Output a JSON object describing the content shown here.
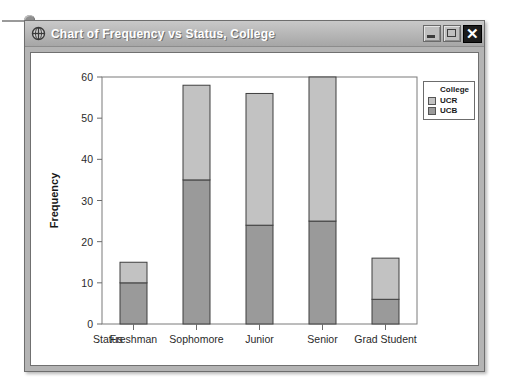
{
  "window": {
    "title": "Chart of Frequency vs Status, College",
    "icon": "crosshair-globe-icon",
    "buttons": {
      "minimize": "_",
      "maximize": "□",
      "close": "✕"
    }
  },
  "legend": {
    "title": "College",
    "entries": [
      {
        "label": "UCR",
        "color": "#c2c2c2"
      },
      {
        "label": "UCB",
        "color": "#9a9a9a"
      }
    ]
  },
  "chart_data": {
    "type": "bar",
    "stacked": true,
    "title": "",
    "xlabel": "Status",
    "ylabel": "Frequency",
    "categories": [
      "Freshman",
      "Sophomore",
      "Junior",
      "Senior",
      "Grad Student"
    ],
    "series": [
      {
        "name": "UCB",
        "color": "#9a9a9a",
        "values": [
          10,
          35,
          24,
          25,
          6
        ]
      },
      {
        "name": "UCR",
        "color": "#c2c2c2",
        "values": [
          5,
          23,
          32,
          35,
          10
        ]
      }
    ],
    "totals": [
      15,
      58,
      56,
      60,
      16
    ],
    "ylim": [
      0,
      60
    ],
    "yticks": [
      0,
      10,
      20,
      30,
      40,
      50,
      60
    ],
    "ytick_labels": [
      "0",
      "10",
      "20",
      "30",
      "40",
      "50",
      "60"
    ],
    "grid": false,
    "legend_position": "right-outside"
  }
}
